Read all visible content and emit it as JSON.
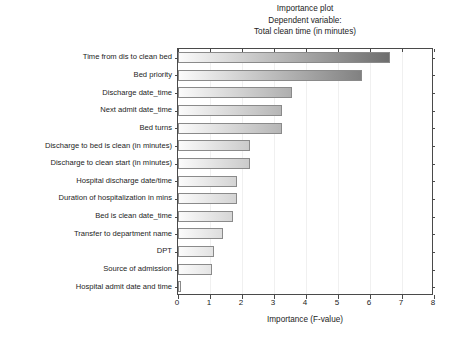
{
  "chart_data": {
    "type": "bar",
    "orientation": "horizontal",
    "title": "Importance plot",
    "subtitle_line2": "Dependent variable:",
    "subtitle_line3": "Total clean time (in minutes)",
    "xlabel": "Importance (F-value)",
    "ylabel": "",
    "xlim": [
      0,
      8
    ],
    "xticks": [
      "0",
      "1",
      "2",
      "3",
      "4",
      "5",
      "6",
      "7",
      "8"
    ],
    "xtick_values": [
      0,
      1,
      2,
      3,
      4,
      5,
      6,
      7,
      8
    ],
    "grid": "vertical-faint",
    "legend": "none",
    "categories": [
      "Time from dis to clean bed",
      "Bed priority",
      "Discharge date_time",
      "Next admit date_time",
      "Bed turns",
      "Discharge to bed is clean (in minutes)",
      "Discharge to clean start (in minutes)",
      "Hospital discharge date/time",
      "Duration of hospitalization in mins",
      "Bed is clean date_time",
      "Transfer to department name",
      "DPT",
      "Source of admission",
      "Hospital admit date and time"
    ],
    "values": [
      6.62,
      5.75,
      3.56,
      3.25,
      3.25,
      2.25,
      2.25,
      1.85,
      1.83,
      1.72,
      1.4,
      1.12,
      1.05,
      0.07
    ],
    "bar_style": {
      "fill": "horizontal-gradient-light-to-dark-gray",
      "gradient_start": "#fbfbfb",
      "gradient_end": "#8c8c8c",
      "edge_color": "#8a8a8a"
    },
    "axis_color": "#4a4a4a",
    "background": "#ffffff"
  }
}
